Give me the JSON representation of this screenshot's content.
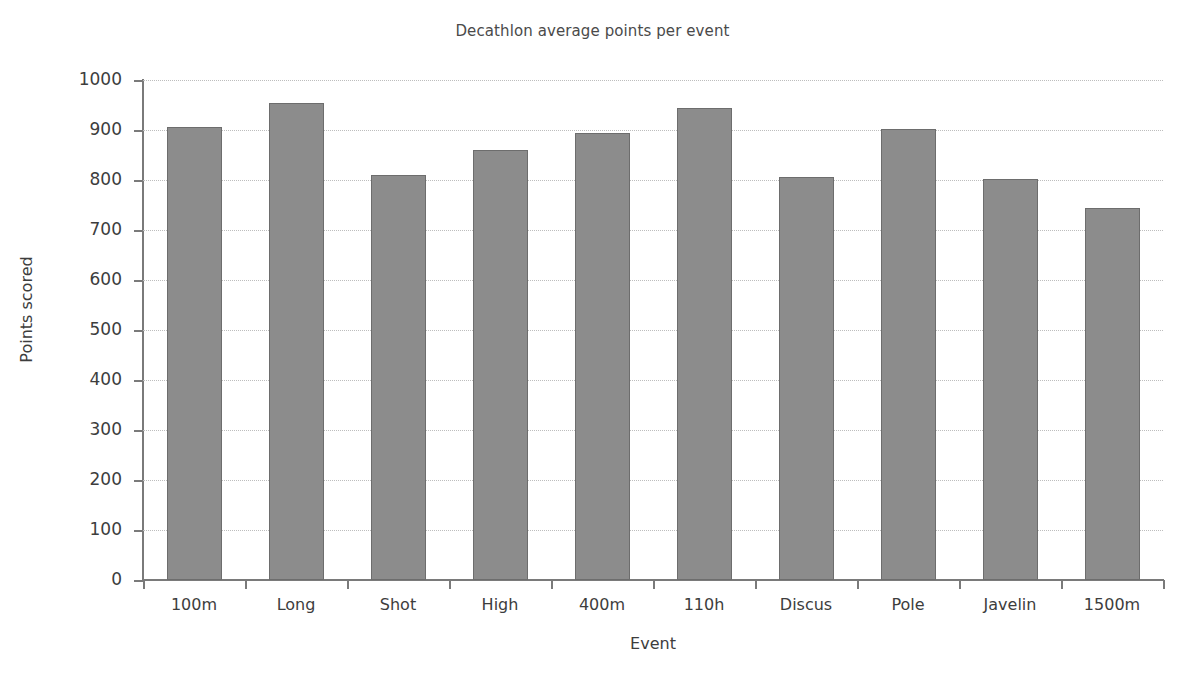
{
  "chart_data": {
    "type": "bar",
    "title": "Decathlon average points per event",
    "xlabel": "Event",
    "ylabel": "Points scored",
    "categories": [
      "100m",
      "Long",
      "Shot",
      "High",
      "400m",
      "110h",
      "Discus",
      "Pole",
      "Javelin",
      "1500m"
    ],
    "values": [
      906,
      954,
      810,
      861,
      895,
      944,
      807,
      903,
      802,
      745
    ],
    "ylim": [
      0,
      1000
    ],
    "yticks": [
      0,
      100,
      200,
      300,
      400,
      500,
      600,
      700,
      800,
      900,
      1000
    ],
    "ytick_labels": [
      "0",
      "100",
      "200",
      "300",
      "400",
      "500",
      "600",
      "700",
      "800",
      "900",
      "1000"
    ],
    "grid": "horizontal-dotted",
    "legend": "none",
    "bar_color": "#8c8c8c",
    "bar_edge_color": "#6d6d6d",
    "background_color": "#ffffff"
  }
}
